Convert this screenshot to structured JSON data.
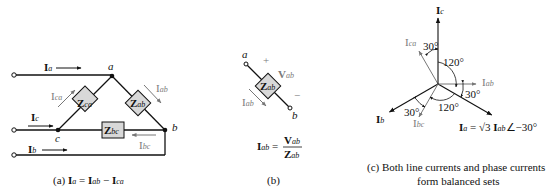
{
  "panel_a": {
    "caption_prefix": "(a) ",
    "caption_eq": {
      "lhs_main": "I",
      "lhs_sub": "a",
      "eq": " = ",
      "t1_main": "I",
      "t1_sub": "ab",
      "minus": " − ",
      "t2_main": "I",
      "t2_sub": "ca"
    },
    "nodes": {
      "a": "a",
      "b": "b",
      "c": "c"
    },
    "impedances": [
      {
        "main": "Z",
        "sub": "ca"
      },
      {
        "main": "Z",
        "sub": "ab"
      },
      {
        "main": "Z",
        "sub": "bc"
      }
    ],
    "line_currents": [
      {
        "main": "I",
        "sub": "a"
      },
      {
        "main": "I",
        "sub": "c"
      },
      {
        "main": "I",
        "sub": "b"
      }
    ],
    "phase_currents": [
      {
        "main": "I",
        "sub": "ca"
      },
      {
        "main": "I",
        "sub": "ab"
      },
      {
        "main": "I",
        "sub": "bc"
      }
    ]
  },
  "panel_b": {
    "caption": "(b)",
    "node_a": "a",
    "node_b": "b",
    "plus": "+",
    "minus": "−",
    "voltage": {
      "main": "V",
      "sub": "ab"
    },
    "impedance": {
      "main": "Z",
      "sub": "ab"
    },
    "current": {
      "main": "I",
      "sub": "ab"
    },
    "equation": {
      "lhs_main": "I",
      "lhs_sub": "ab",
      "eq": " =",
      "num_main": "V",
      "num_sub": "ab",
      "den_main": "Z",
      "den_sub": "ab"
    }
  },
  "panel_c": {
    "caption_line1": "(c) Both line currents and phase currents",
    "caption_line2": "form balanced sets",
    "phasors": [
      {
        "name": "Ic",
        "main": "I",
        "sub": "c",
        "angle_deg": 90,
        "type": "line"
      },
      {
        "name": "Ica",
        "main": "I",
        "sub": "ca",
        "angle_deg": 120,
        "type": "phase"
      },
      {
        "name": "Iab",
        "main": "I",
        "sub": "ab",
        "angle_deg": 0,
        "type": "phase"
      },
      {
        "name": "Ia",
        "main": "I",
        "sub": "a",
        "angle_deg": -30,
        "type": "line"
      },
      {
        "name": "Ibc",
        "main": "I",
        "sub": "bc",
        "angle_deg": -120,
        "type": "phase"
      },
      {
        "name": "Ib",
        "main": "I",
        "sub": "b",
        "angle_deg": -150,
        "type": "line"
      }
    ],
    "angle_labels": [
      "30°",
      "120°",
      "30°",
      "120°",
      "30°"
    ],
    "relation": {
      "lhs_main": "I",
      "lhs_sub": "a",
      "eq": " = ",
      "sqrt": "√3",
      "rhs_main": "I",
      "rhs_sub": "ab",
      "angle": "∠−30°"
    }
  }
}
